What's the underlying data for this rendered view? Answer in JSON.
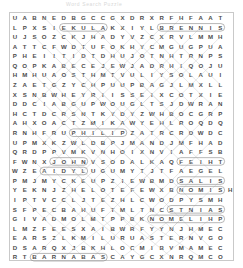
{
  "title": "Word Search Puzzle",
  "puzzle": {
    "rows": 23,
    "cols": 22,
    "letter_color": "#4c4c4c",
    "mark_color": "#9a9a9a",
    "border_color": "#c9c9c9",
    "grid": [
      "UABNEDBGCCGXDRXRFHFAAT",
      "LPXSIEKULAKXIYLBRENNIS",
      "UJSOZCKJHADYVZCXRVLMMH",
      "ATTCFWDTUFOKHYCMGUGPUA",
      "PHEIITIDTDHUJOTNHTRNPS",
      "QOPKABECEJEWJADRHIQOJU",
      "HMHUAOSTHMTVULIYSOLAUI",
      "ZAETGZYCHPUUPBAGJLMXLL",
      "XSNBWHEYRIISSEIXCOTXIE",
      "DDCIABGUPWOUGLTSJDWRAN",
      "HCTDCRSNTKYDYZWHBOCGRP",
      "AHXOACTZMIKAWYEHLROQDQ",
      "RNHFRUPHILIPZATRCRDWDC",
      "UPMXKZWLDBPJMANDJMFHAD",
      "QRDPPVMKVNHOIXNVIAFFSB",
      "FWNXJOHNVSODALKAQFEIHT",
      "WZEAIDYLUGUMYTJTFAEGEL",
      "PMJMYCKEUPZIEWBMDSALIS",
      "YEKNJZHELOTEFEWXBNOMISH",
      "IPTVCCLJTEZHLCWODPYSMH",
      "SFPECBAHUFTMLTNCSTNIAS",
      "GIVADMOLMTPPBKNOMELIHP",
      "LMZFEESXAIBWRFYYNJHMEC",
      "EARSZLKMILURUASTERNVGO",
      "DSARQXJBKHLOCMIBVMAMEC",
      "RTBARNABASCAYGCXNRQMCO"
    ]
  },
  "found_words": [
    {
      "word": "BRENNIS",
      "row": 1,
      "col": 15,
      "dir": "horizontal"
    },
    {
      "word": "PHILIP",
      "row": 12,
      "col": 6,
      "dir": "horizontal"
    },
    {
      "word": "JOHN",
      "row": 15,
      "col": 4,
      "dir": "horizontal"
    },
    {
      "word": "FEIHT",
      "row": 15,
      "col": 17,
      "dir": "horizontal"
    },
    {
      "word": "SALIS",
      "row": 17,
      "col": 17,
      "dir": "horizontal"
    },
    {
      "word": "NOMIS",
      "row": 18,
      "col": 17,
      "dir": "horizontal"
    },
    {
      "word": "STNIAS",
      "row": 20,
      "col": 16,
      "dir": "horizontal"
    },
    {
      "word": "NOMELIHP",
      "row": 21,
      "col": 14,
      "dir": "horizontal"
    },
    {
      "word": "BARNABAS",
      "row": 25,
      "col": 2,
      "dir": "horizontal"
    },
    {
      "word": "AIDYL",
      "row": 16,
      "col": 3,
      "dir": "horizontal"
    },
    {
      "word": "EKULA",
      "row": 1,
      "col": 5,
      "dir": "horizontal"
    }
  ]
}
